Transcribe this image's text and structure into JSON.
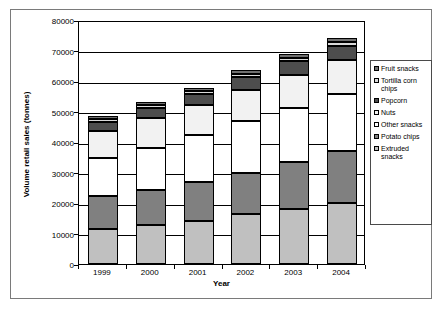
{
  "chart_data": {
    "type": "bar",
    "subtype": "stacked-bar",
    "title": "",
    "xlabel": "Year",
    "ylabel": "Volume retail sales (tonnes)",
    "categories": [
      "1999",
      "2000",
      "2001",
      "2002",
      "2003",
      "2004"
    ],
    "ylim": [
      0,
      80000
    ],
    "ytick_labels": [
      "0",
      "10000",
      "20000",
      "30000",
      "40000",
      "50000",
      "60000",
      "70000",
      "80000"
    ],
    "ytick_values": [
      0,
      10000,
      20000,
      30000,
      40000,
      50000,
      60000,
      70000,
      80000
    ],
    "grid": true,
    "legend_position": "right",
    "stack_order_bottom_to_top": [
      "Extruded snacks",
      "Potato chips",
      "Other snacks",
      "Nuts",
      "Popcorn",
      "Tortilla corn chips",
      "Fruit snacks"
    ],
    "series": [
      {
        "name": "Extruded snacks",
        "color": "#c0c0c0",
        "values": [
          11500,
          12900,
          14100,
          16300,
          17900,
          20100
        ]
      },
      {
        "name": "Potato chips",
        "color": "#808080",
        "values": [
          10800,
          11500,
          12900,
          13700,
          15400,
          17100
        ]
      },
      {
        "name": "Other snacks",
        "color": "#ffffff",
        "values": [
          12500,
          13800,
          15200,
          16800,
          17800,
          18600
        ]
      },
      {
        "name": "Nuts",
        "color": "#f2f2f2",
        "values": [
          8700,
          9600,
          9900,
          10200,
          11000,
          11100
        ]
      },
      {
        "name": "Popcorn",
        "color": "#4d4d4d",
        "values": [
          3000,
          3300,
          3600,
          4200,
          4400,
          4700
        ]
      },
      {
        "name": "Tortilla corn chips",
        "color": "#d9d9d9",
        "values": [
          1200,
          1000,
          1100,
          1200,
          1200,
          1300
        ]
      },
      {
        "name": "Fruit snacks",
        "color": "#707070",
        "values": [
          800,
          900,
          1000,
          1200,
          1100,
          1200
        ]
      }
    ],
    "totals": [
      48500,
      53000,
      57800,
      63600,
      68800,
      74100
    ]
  },
  "legend": {
    "entries": [
      {
        "label": "Fruit snacks",
        "color": "#707070"
      },
      {
        "label": "Tortilla corn chips",
        "color": "#d9d9d9"
      },
      {
        "label": "Popcorn",
        "color": "#4d4d4d"
      },
      {
        "label": "Nuts",
        "color": "#f2f2f2"
      },
      {
        "label": "Other snacks",
        "color": "#ffffff"
      },
      {
        "label": "Potato chips",
        "color": "#808080"
      },
      {
        "label": "Extruded snacks",
        "color": "#c0c0c0"
      }
    ]
  }
}
